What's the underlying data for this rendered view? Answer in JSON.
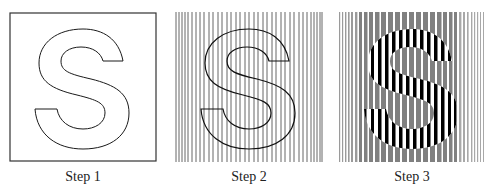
{
  "figure": {
    "steps": [
      {
        "label": "Step 1",
        "description": "Outline of letter S inside a square frame"
      },
      {
        "label": "Step 2",
        "description": "Letter S outline overlaid on vertical line grating"
      },
      {
        "label": "Step 3",
        "description": "Letter S filled with black/white stripes over gray striped background"
      }
    ],
    "glyph": "S",
    "colors": {
      "outline": "#1a1a1a",
      "grating": "#555555",
      "stripe_dark": "#000000",
      "stripe_gray": "#7a7a7a",
      "background": "#ffffff"
    }
  }
}
